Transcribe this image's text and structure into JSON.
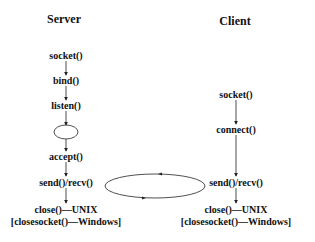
{
  "diagram": {
    "server": {
      "title": "Server",
      "steps": {
        "socket": "socket()",
        "bind": "bind()",
        "listen": "listen()",
        "accept": "accept()",
        "sendrecv": "send()/recv()",
        "close": "close()—UNIX",
        "closesocket": "[closesocket()—Windows]"
      }
    },
    "client": {
      "title": "Client",
      "steps": {
        "socket": "socket()",
        "connect": "connect()",
        "sendrecv": "send()/recv()",
        "close": "close()—UNIX",
        "closesocket": "[closesocket()—Windows]"
      }
    },
    "colors": {
      "line": "#222222",
      "text": "#111111",
      "background": "#ffffff"
    }
  }
}
